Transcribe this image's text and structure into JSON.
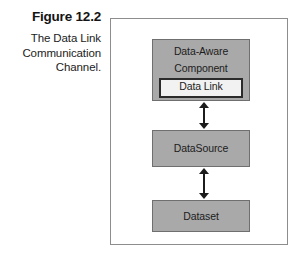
{
  "figure": {
    "number": "Figure 12.2",
    "caption": "The Data Link Communication Channel."
  },
  "diagram": {
    "type": "block-diagram",
    "nodes": [
      {
        "id": "data-aware-component",
        "label_line1": "Data-Aware",
        "label_line2": "Component",
        "fill": "#a9a9a9",
        "border": "#6f6f6f"
      },
      {
        "id": "data-link",
        "label": "Data Link",
        "fill": "#f2f2f2",
        "border": "#2b2b2b",
        "nested_in": "data-aware-component"
      },
      {
        "id": "datasource",
        "label": "DataSource",
        "fill": "#a9a9a9",
        "border": "#6f6f6f"
      },
      {
        "id": "dataset",
        "label": "Dataset",
        "fill": "#a9a9a9",
        "border": "#6f6f6f"
      }
    ],
    "connectors": [
      {
        "id": "connector-component-datasource",
        "from": "data-aware-component",
        "to": "datasource",
        "style": "double-headed-arrow"
      },
      {
        "id": "connector-datasource-dataset",
        "from": "datasource",
        "to": "dataset",
        "style": "double-headed-arrow"
      }
    ],
    "frame_border_color": "#8d8d8d",
    "background": "#ffffff"
  }
}
